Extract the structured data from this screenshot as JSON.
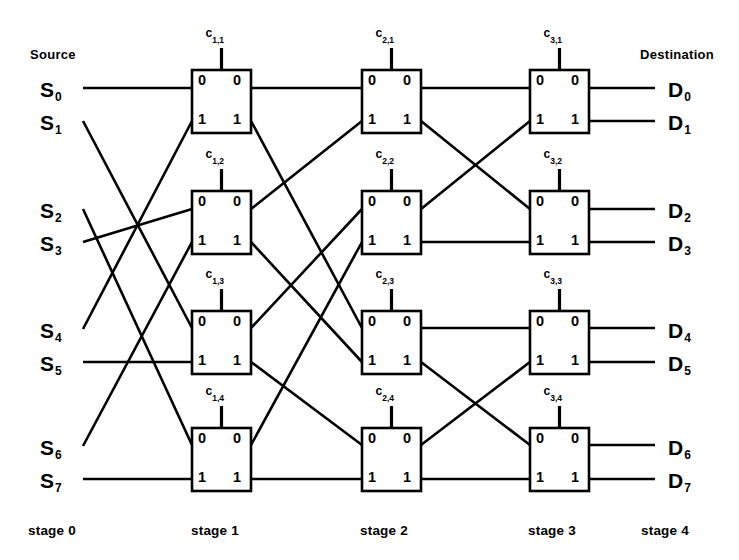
{
  "diagram": {
    "title_source": "Source",
    "title_destination": "Destination",
    "port_label_0": "0",
    "port_label_1": "1",
    "line_color": "#000000",
    "box_fill": "#ffffff",
    "box_stroke": "#000000"
  },
  "sources": [
    {
      "label": "S",
      "sub": "0",
      "x": 40,
      "y": 95
    },
    {
      "label": "S",
      "sub": "1",
      "x": 40,
      "y": 128
    },
    {
      "label": "S",
      "sub": "2",
      "x": 40,
      "y": 216
    },
    {
      "label": "S",
      "sub": "3",
      "x": 40,
      "y": 249
    },
    {
      "label": "S",
      "sub": "4",
      "x": 40,
      "y": 336
    },
    {
      "label": "S",
      "sub": "5",
      "x": 40,
      "y": 369
    },
    {
      "label": "S",
      "sub": "6",
      "x": 40,
      "y": 453
    },
    {
      "label": "S",
      "sub": "7",
      "x": 40,
      "y": 486
    }
  ],
  "destinations": [
    {
      "label": "D",
      "sub": "0",
      "x": 668,
      "y": 95
    },
    {
      "label": "D",
      "sub": "1",
      "x": 668,
      "y": 128
    },
    {
      "label": "D",
      "sub": "2",
      "x": 668,
      "y": 216
    },
    {
      "label": "D",
      "sub": "3",
      "x": 668,
      "y": 249
    },
    {
      "label": "D",
      "sub": "4",
      "x": 668,
      "y": 336
    },
    {
      "label": "D",
      "sub": "5",
      "x": 668,
      "y": 369
    },
    {
      "label": "D",
      "sub": "6",
      "x": 668,
      "y": 453
    },
    {
      "label": "D",
      "sub": "7",
      "x": 668,
      "y": 486
    }
  ],
  "stages": [
    {
      "name": "stage 0",
      "x": 28,
      "y": 523
    },
    {
      "name": "stage 1",
      "x": 191,
      "y": 523
    },
    {
      "name": "stage 2",
      "x": 360,
      "y": 523
    },
    {
      "name": "stage 3",
      "x": 528,
      "y": 523
    },
    {
      "name": "stage 4",
      "x": 641,
      "y": 523
    }
  ],
  "switches": [
    {
      "id": "c1_1",
      "control": "c",
      "sub": "1,1",
      "stage": 1,
      "row": 1,
      "x": 192,
      "y": 70,
      "w": 59,
      "h": 63
    },
    {
      "id": "c1_2",
      "control": "c",
      "sub": "1,2",
      "stage": 1,
      "row": 2,
      "x": 192,
      "y": 191,
      "w": 59,
      "h": 63
    },
    {
      "id": "c1_3",
      "control": "c",
      "sub": "1,3",
      "stage": 1,
      "row": 3,
      "x": 192,
      "y": 311,
      "w": 59,
      "h": 63
    },
    {
      "id": "c1_4",
      "control": "c",
      "sub": "1,4",
      "stage": 1,
      "row": 4,
      "x": 192,
      "y": 428,
      "w": 59,
      "h": 63
    },
    {
      "id": "c2_1",
      "control": "c",
      "sub": "2,1",
      "stage": 2,
      "row": 1,
      "x": 362,
      "y": 70,
      "w": 59,
      "h": 63
    },
    {
      "id": "c2_2",
      "control": "c",
      "sub": "2,2",
      "stage": 2,
      "row": 2,
      "x": 362,
      "y": 191,
      "w": 59,
      "h": 63
    },
    {
      "id": "c2_3",
      "control": "c",
      "sub": "2,3",
      "stage": 2,
      "row": 3,
      "x": 362,
      "y": 311,
      "w": 59,
      "h": 63
    },
    {
      "id": "c2_4",
      "control": "c",
      "sub": "2,4",
      "stage": 2,
      "row": 4,
      "x": 362,
      "y": 428,
      "w": 59,
      "h": 63
    },
    {
      "id": "c3_1",
      "control": "c",
      "sub": "3,1",
      "stage": 3,
      "row": 1,
      "x": 530,
      "y": 70,
      "w": 59,
      "h": 63
    },
    {
      "id": "c3_2",
      "control": "c",
      "sub": "3,2",
      "stage": 3,
      "row": 2,
      "x": 530,
      "y": 191,
      "w": 59,
      "h": 63
    },
    {
      "id": "c3_3",
      "control": "c",
      "sub": "3,3",
      "stage": 3,
      "row": 3,
      "x": 530,
      "y": 311,
      "w": 59,
      "h": 63
    },
    {
      "id": "c3_4",
      "control": "c",
      "sub": "3,4",
      "stage": 3,
      "row": 4,
      "x": 530,
      "y": 428,
      "w": 59,
      "h": 63
    }
  ],
  "links": {
    "stage0_to_1": [
      {
        "from": "S0",
        "to": "c1_1.0",
        "x1": 83,
        "y1": 88,
        "x2": 192,
        "y2": 88
      },
      {
        "from": "S1",
        "to": "c1_3.0",
        "x1": 83,
        "y1": 121,
        "x2": 192,
        "y2": 328
      },
      {
        "from": "S2",
        "to": "c1_4.0",
        "x1": 83,
        "y1": 209,
        "x2": 192,
        "y2": 445
      },
      {
        "from": "S3",
        "to": "c1_2.0",
        "x1": 83,
        "y1": 242,
        "x2": 192,
        "y2": 209
      },
      {
        "from": "S4",
        "to": "c1_1.1",
        "x1": 83,
        "y1": 329,
        "x2": 192,
        "y2": 121
      },
      {
        "from": "S5",
        "to": "c1_3.1",
        "x1": 83,
        "y1": 362,
        "x2": 192,
        "y2": 362
      },
      {
        "from": "S6",
        "to": "c1_2.1",
        "x1": 83,
        "y1": 446,
        "x2": 192,
        "y2": 242
      },
      {
        "from": "S7",
        "to": "c1_4.1",
        "x1": 83,
        "y1": 479,
        "x2": 192,
        "y2": 479
      }
    ],
    "stage1_to_2": [
      {
        "from": "c1_1.0",
        "to": "c2_1.0",
        "x1": 251,
        "y1": 88,
        "x2": 362,
        "y2": 88
      },
      {
        "from": "c1_1.1",
        "to": "c2_3.0",
        "x1": 251,
        "y1": 121,
        "x2": 362,
        "y2": 328
      },
      {
        "from": "c1_2.0",
        "to": "c2_1.1",
        "x1": 251,
        "y1": 209,
        "x2": 362,
        "y2": 121
      },
      {
        "from": "c1_2.1",
        "to": "c2_3.1",
        "x1": 251,
        "y1": 242,
        "x2": 362,
        "y2": 362
      },
      {
        "from": "c1_3.0",
        "to": "c2_2.0",
        "x1": 251,
        "y1": 328,
        "x2": 362,
        "y2": 209
      },
      {
        "from": "c1_3.1",
        "to": "c2_4.0",
        "x1": 251,
        "y1": 362,
        "x2": 362,
        "y2": 445
      },
      {
        "from": "c1_4.0",
        "to": "c2_2.1",
        "x1": 251,
        "y1": 445,
        "x2": 362,
        "y2": 242
      },
      {
        "from": "c1_4.1",
        "to": "c2_4.1",
        "x1": 251,
        "y1": 479,
        "x2": 362,
        "y2": 479
      }
    ],
    "stage2_to_3": [
      {
        "from": "c2_1.0",
        "to": "c3_1.0",
        "x1": 421,
        "y1": 88,
        "x2": 530,
        "y2": 88
      },
      {
        "from": "c2_1.1",
        "to": "c3_2.0",
        "x1": 421,
        "y1": 121,
        "x2": 530,
        "y2": 209
      },
      {
        "from": "c2_2.0",
        "to": "c3_1.1",
        "x1": 421,
        "y1": 209,
        "x2": 530,
        "y2": 121
      },
      {
        "from": "c2_2.1",
        "to": "c3_2.1",
        "x1": 421,
        "y1": 242,
        "x2": 530,
        "y2": 242
      },
      {
        "from": "c2_3.0",
        "to": "c3_3.0",
        "x1": 421,
        "y1": 328,
        "x2": 530,
        "y2": 328
      },
      {
        "from": "c2_3.1",
        "to": "c3_4.0",
        "x1": 421,
        "y1": 362,
        "x2": 530,
        "y2": 445
      },
      {
        "from": "c2_4.0",
        "to": "c3_3.1",
        "x1": 421,
        "y1": 445,
        "x2": 530,
        "y2": 362
      },
      {
        "from": "c2_4.1",
        "to": "c3_4.1",
        "x1": 421,
        "y1": 479,
        "x2": 530,
        "y2": 479
      }
    ],
    "stage3_to_4": [
      {
        "from": "c3_1.0",
        "to": "D0",
        "x1": 589,
        "y1": 88,
        "x2": 655,
        "y2": 88
      },
      {
        "from": "c3_1.1",
        "to": "D1",
        "x1": 589,
        "y1": 121,
        "x2": 655,
        "y2": 121
      },
      {
        "from": "c3_2.0",
        "to": "D2",
        "x1": 589,
        "y1": 209,
        "x2": 655,
        "y2": 209
      },
      {
        "from": "c3_2.1",
        "to": "D3",
        "x1": 589,
        "y1": 242,
        "x2": 655,
        "y2": 242
      },
      {
        "from": "c3_3.0",
        "to": "D4",
        "x1": 589,
        "y1": 328,
        "x2": 655,
        "y2": 328
      },
      {
        "from": "c3_3.1",
        "to": "D5",
        "x1": 589,
        "y1": 362,
        "x2": 655,
        "y2": 362
      },
      {
        "from": "c3_4.0",
        "to": "D6",
        "x1": 589,
        "y1": 445,
        "x2": 655,
        "y2": 445
      },
      {
        "from": "c3_4.1",
        "to": "D7",
        "x1": 589,
        "y1": 479,
        "x2": 655,
        "y2": 479
      }
    ]
  },
  "headers": {
    "source": {
      "text": "Source",
      "x": 30,
      "y": 47
    },
    "destination": {
      "text": "Destination",
      "x": 640,
      "y": 47
    }
  }
}
